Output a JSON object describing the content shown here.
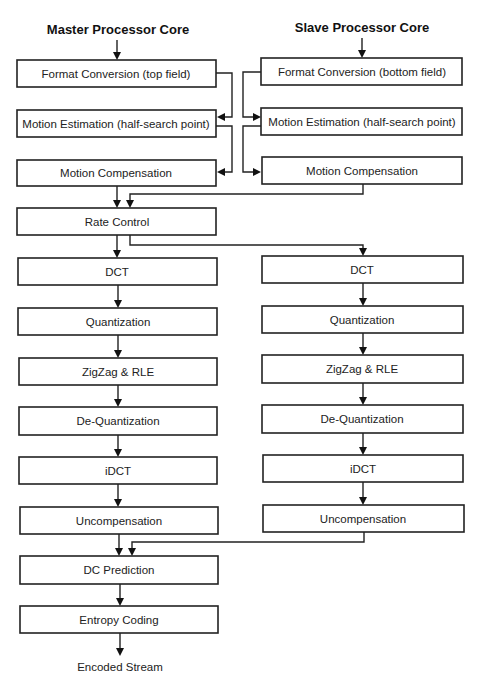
{
  "diagram": {
    "titles": {
      "master": "Master Processor Core",
      "slave": "Slave Processor Core"
    },
    "master_column": {
      "format_conversion": "Format Conversion (top field)",
      "motion_estimation": "Motion Estimation (half-search point)",
      "motion_compensation": "Motion Compensation",
      "rate_control": "Rate Control",
      "dct": "DCT",
      "quantization": "Quantization",
      "zigzag_rle": "ZigZag & RLE",
      "de_quantization": "De-Quantization",
      "idct": "iDCT",
      "uncompensation": "Uncompensation",
      "dc_prediction": "DC Prediction",
      "entropy_coding": "Entropy Coding"
    },
    "slave_column": {
      "format_conversion": "Format Conversion (bottom field)",
      "motion_estimation": "Motion Estimation (half-search point)",
      "motion_compensation": "Motion Compensation",
      "dct": "DCT",
      "quantization": "Quantization",
      "zigzag_rle": "ZigZag & RLE",
      "de_quantization": "De-Quantization",
      "idct": "iDCT",
      "uncompensation": "Uncompensation"
    },
    "output_label": "Encoded Stream",
    "edges": [
      [
        "master.format_conversion",
        "master.motion_estimation"
      ],
      [
        "master.format_conversion",
        "slave.motion_estimation"
      ],
      [
        "slave.format_conversion",
        "master.motion_estimation"
      ],
      [
        "slave.format_conversion",
        "slave.motion_estimation"
      ],
      [
        "master.motion_estimation",
        "master.motion_compensation"
      ],
      [
        "master.motion_estimation",
        "slave.motion_compensation"
      ],
      [
        "slave.motion_estimation",
        "master.motion_compensation"
      ],
      [
        "slave.motion_estimation",
        "slave.motion_compensation"
      ],
      [
        "master.motion_compensation",
        "master.rate_control"
      ],
      [
        "slave.motion_compensation",
        "master.rate_control"
      ],
      [
        "master.rate_control",
        "master.dct"
      ],
      [
        "master.rate_control",
        "slave.dct"
      ],
      [
        "master.dct",
        "master.quantization"
      ],
      [
        "master.quantization",
        "master.zigzag_rle"
      ],
      [
        "master.zigzag_rle",
        "master.de_quantization"
      ],
      [
        "master.de_quantization",
        "master.idct"
      ],
      [
        "master.idct",
        "master.uncompensation"
      ],
      [
        "slave.dct",
        "slave.quantization"
      ],
      [
        "slave.quantization",
        "slave.zigzag_rle"
      ],
      [
        "slave.zigzag_rle",
        "slave.de_quantization"
      ],
      [
        "slave.de_quantization",
        "slave.idct"
      ],
      [
        "slave.idct",
        "slave.uncompensation"
      ],
      [
        "master.uncompensation",
        "master.dc_prediction"
      ],
      [
        "slave.uncompensation",
        "master.dc_prediction"
      ],
      [
        "master.dc_prediction",
        "master.entropy_coding"
      ],
      [
        "master.entropy_coding",
        "output"
      ]
    ]
  }
}
